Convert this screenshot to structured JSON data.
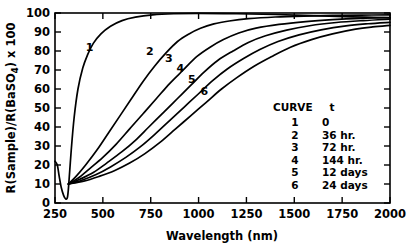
{
  "chart_data": {
    "type": "line",
    "title": "",
    "xlabel": "Wavelength (nm)",
    "ylabel": "R(Sample)/R(BaSO4) x 100",
    "ylabel_parts": {
      "pre": "R(Sample)/R(BaSO",
      "sub": "4",
      "post": ") x 100"
    },
    "xlim": [
      250,
      2000
    ],
    "ylim": [
      0,
      100
    ],
    "xticks": [
      250,
      500,
      750,
      1000,
      1250,
      1500,
      1750,
      2000
    ],
    "xtick_labels": [
      "250",
      "500",
      "750",
      "1000",
      "1250",
      "1500",
      "1750",
      "2000"
    ],
    "yticks": [
      0,
      10,
      20,
      30,
      40,
      50,
      60,
      70,
      80,
      90,
      100
    ],
    "ytick_labels": [
      "0",
      "10",
      "20",
      "30",
      "40",
      "50",
      "60",
      "70",
      "80",
      "90",
      "100"
    ],
    "grid": false,
    "legend_position": "inside-lower-right",
    "series": [
      {
        "name": "1",
        "label": "1",
        "t": "0",
        "label_x": 430,
        "label_y": 80,
        "points": [
          [
            250,
            22
          ],
          [
            262,
            20
          ],
          [
            272,
            14
          ],
          [
            283,
            8
          ],
          [
            295,
            4
          ],
          [
            305,
            2.2
          ],
          [
            315,
            3
          ],
          [
            322,
            10
          ],
          [
            335,
            28
          ],
          [
            350,
            45
          ],
          [
            370,
            60
          ],
          [
            395,
            71
          ],
          [
            420,
            78
          ],
          [
            450,
            84
          ],
          [
            490,
            89
          ],
          [
            540,
            93
          ],
          [
            600,
            96
          ],
          [
            670,
            97.8
          ],
          [
            760,
            99
          ],
          [
            870,
            99.6
          ],
          [
            1000,
            99.8
          ],
          [
            1200,
            99.6
          ],
          [
            1400,
            99.2
          ],
          [
            1600,
            98.6
          ],
          [
            1800,
            98.0
          ],
          [
            2000,
            97.4
          ]
        ]
      },
      {
        "name": "2",
        "label": "2",
        "t": "36 hr.",
        "label_x": 745,
        "label_y": 78,
        "points": [
          [
            320,
            10
          ],
          [
            360,
            14
          ],
          [
            410,
            20
          ],
          [
            470,
            28
          ],
          [
            530,
            37
          ],
          [
            590,
            46
          ],
          [
            650,
            55
          ],
          [
            710,
            64
          ],
          [
            770,
            72
          ],
          [
            830,
            79
          ],
          [
            890,
            85
          ],
          [
            950,
            89
          ],
          [
            1010,
            92
          ],
          [
            1080,
            94.3
          ],
          [
            1160,
            95.8
          ],
          [
            1260,
            97.0
          ],
          [
            1400,
            97.9
          ],
          [
            1550,
            98.4
          ],
          [
            1700,
            98.7
          ],
          [
            1850,
            98.9
          ],
          [
            2000,
            99.0
          ]
        ]
      },
      {
        "name": "3",
        "label": "3",
        "t": "72 hr.",
        "label_x": 845,
        "label_y": 74,
        "points": [
          [
            320,
            10
          ],
          [
            370,
            13
          ],
          [
            430,
            18
          ],
          [
            500,
            24
          ],
          [
            570,
            31
          ],
          [
            640,
            39
          ],
          [
            710,
            47
          ],
          [
            780,
            55
          ],
          [
            850,
            63
          ],
          [
            920,
            70
          ],
          [
            990,
            77
          ],
          [
            1060,
            82
          ],
          [
            1130,
            86
          ],
          [
            1210,
            89.5
          ],
          [
            1300,
            92
          ],
          [
            1420,
            94
          ],
          [
            1560,
            95.5
          ],
          [
            1700,
            96.5
          ],
          [
            1850,
            97.2
          ],
          [
            2000,
            97.6
          ]
        ]
      },
      {
        "name": "4",
        "label": "4",
        "t": "144 hr.",
        "label_x": 905,
        "label_y": 69,
        "points": [
          [
            320,
            10
          ],
          [
            380,
            12.5
          ],
          [
            450,
            16
          ],
          [
            520,
            21
          ],
          [
            600,
            27
          ],
          [
            670,
            33
          ],
          [
            740,
            40
          ],
          [
            820,
            48
          ],
          [
            890,
            55
          ],
          [
            960,
            62
          ],
          [
            1030,
            69
          ],
          [
            1100,
            75
          ],
          [
            1180,
            80
          ],
          [
            1260,
            84.5
          ],
          [
            1350,
            88
          ],
          [
            1460,
            91
          ],
          [
            1580,
            93.3
          ],
          [
            1720,
            95.0
          ],
          [
            1860,
            96.0
          ],
          [
            2000,
            96.7
          ]
        ]
      },
      {
        "name": "5",
        "label": "5",
        "t": "12 days",
        "label_x": 965,
        "label_y": 63
      },
      {
        "name": "6",
        "label": "6",
        "t": "24 days",
        "label_x": 1030,
        "label_y": 57,
        "points": [
          [
            320,
            10
          ],
          [
            400,
            11.5
          ],
          [
            480,
            14
          ],
          [
            560,
            17
          ],
          [
            640,
            21
          ],
          [
            720,
            26
          ],
          [
            800,
            32
          ],
          [
            880,
            39
          ],
          [
            960,
            46
          ],
          [
            1040,
            53
          ],
          [
            1120,
            60
          ],
          [
            1200,
            66
          ],
          [
            1290,
            72
          ],
          [
            1380,
            77
          ],
          [
            1480,
            82
          ],
          [
            1590,
            86
          ],
          [
            1700,
            89
          ],
          [
            1820,
            91.5
          ],
          [
            1910,
            92.7
          ],
          [
            2000,
            93.5
          ]
        ]
      }
    ]
  },
  "legend": {
    "header_curve": "CURVE",
    "header_t": "t",
    "rows": [
      {
        "curve": "1",
        "t": "0"
      },
      {
        "curve": "2",
        "t": "36 hr."
      },
      {
        "curve": "3",
        "t": "72 hr."
      },
      {
        "curve": "4",
        "t": "144 hr."
      },
      {
        "curve": "5",
        "t": "12 days"
      },
      {
        "curve": "6",
        "t": "24 days"
      }
    ]
  },
  "style": {
    "line_color": "#000000",
    "background": "#ffffff"
  }
}
